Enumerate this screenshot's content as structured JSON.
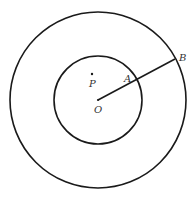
{
  "diagram": {
    "type": "concentric-circles",
    "center": {
      "x": 98,
      "y": 100
    },
    "outer_radius": 88,
    "inner_radius": 44,
    "stroke_color": "#1a1a1a",
    "labels": {
      "center": "O",
      "inner_point": "A",
      "outer_point": "B",
      "free_point": "P"
    },
    "points": {
      "O": {
        "x": 98,
        "y": 100
      },
      "A": {
        "x": 137,
        "y": 80
      },
      "B": {
        "x": 175,
        "y": 59
      },
      "P": {
        "x": 92,
        "y": 74
      }
    },
    "segments": [
      {
        "from": "O",
        "to": "B"
      }
    ]
  }
}
